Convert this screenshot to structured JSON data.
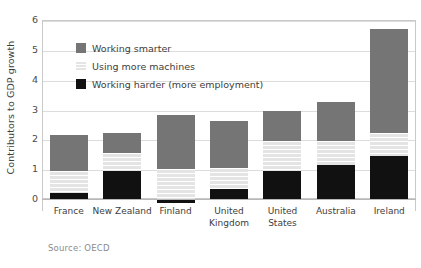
{
  "chart_data": {
    "type": "bar",
    "subtype": "stacked-bar",
    "title": "",
    "xlabel": "",
    "ylabel": "Contributors to GDP growth",
    "ylim": [
      0,
      6
    ],
    "yticks": [
      0,
      1,
      2,
      3,
      4,
      5,
      6
    ],
    "grid": true,
    "legend_position": "inside-top-left",
    "categories": [
      "France",
      "New Zealand",
      "Finland",
      "United Kingdom",
      "United States",
      "Australia",
      "Ireland"
    ],
    "series": [
      {
        "name": "Working harder (more employment)",
        "color": "#111111",
        "values": [
          0.2,
          0.95,
          -0.15,
          0.35,
          0.95,
          1.15,
          1.45
        ]
      },
      {
        "name": "Using more machines",
        "color": "#e4e4e4",
        "values": [
          0.75,
          0.6,
          1.0,
          0.7,
          1.0,
          0.8,
          0.75
        ]
      },
      {
        "name": "Working smarter",
        "color": "#757575",
        "values": [
          1.2,
          0.65,
          1.8,
          1.55,
          1.0,
          1.3,
          3.5
        ]
      }
    ],
    "totals": [
      2.15,
      2.2,
      2.65,
      2.6,
      2.95,
      3.25,
      5.7
    ],
    "annotations": {
      "source": "Source: OECD"
    }
  },
  "legend": {
    "items": [
      {
        "label": "Working smarter",
        "swatch": "#757575"
      },
      {
        "label": "Using more machines",
        "swatch": "#e4e4e4"
      },
      {
        "label": "Working harder (more employment)",
        "swatch": "#111111"
      }
    ]
  },
  "axis": {
    "y_title": "Contributors to GDP growth",
    "y_tick_labels": [
      "6",
      "5",
      "4",
      "3",
      "2",
      "1",
      "0"
    ],
    "x_tick_labels": [
      [
        "France"
      ],
      [
        "New Zealand"
      ],
      [
        "Finland"
      ],
      [
        "United",
        "Kingdom"
      ],
      [
        "United",
        "States"
      ],
      [
        "Australia"
      ],
      [
        "Ireland"
      ]
    ]
  },
  "footer": {
    "source": "Source: OECD"
  },
  "colors": {
    "smarter": "#757575",
    "machines": "#e4e4e4",
    "harder": "#111111",
    "grid": "#dcdcdc",
    "frame": "#c9c9c9",
    "text": "#3d3d3d",
    "muted": "#8a8a8a"
  }
}
